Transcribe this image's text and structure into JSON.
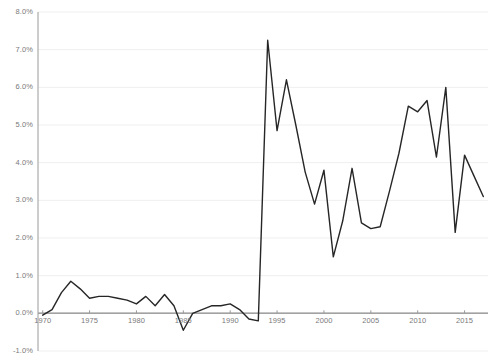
{
  "chart_data": {
    "type": "line",
    "title": "",
    "subtitle": "",
    "xlabel": "",
    "ylabel": "",
    "grid": true,
    "grid_axis": "y",
    "legend": false,
    "legend_position": "none",
    "xlim": [
      1969.5,
      2017.5
    ],
    "ylim": [
      -1.0,
      8.0
    ],
    "y_tick_labels": [
      "8.0%",
      "7.0%",
      "6.0%",
      "5.0%",
      "4.0%",
      "3.0%",
      "2.0%",
      "1.0%",
      "0.0%",
      "-1.0%"
    ],
    "y_tick_values": [
      8.0,
      7.0,
      6.0,
      5.0,
      4.0,
      3.0,
      2.0,
      1.0,
      0.0,
      -1.0
    ],
    "x_tick_labels": [
      "1970",
      "1975",
      "1980",
      "1985",
      "1990",
      "1995",
      "2000",
      "2005",
      "2010",
      "2015"
    ],
    "x_tick_values": [
      1970,
      1975,
      1980,
      1985,
      1990,
      1995,
      2000,
      2005,
      2010,
      2015
    ],
    "zero_line": 0.0,
    "series": [
      {
        "name": "series-1",
        "color": "#262626",
        "x": [
          1970,
          1971,
          1972,
          1973,
          1974,
          1975,
          1976,
          1977,
          1978,
          1979,
          1980,
          1981,
          1982,
          1983,
          1984,
          1985,
          1986,
          1987,
          1988,
          1989,
          1990,
          1991,
          1992,
          1993,
          1994,
          1995,
          1996,
          1997,
          1998,
          1999,
          2000,
          2001,
          2002,
          2003,
          2004,
          2005,
          2006,
          2007,
          2008,
          2009,
          2010,
          2011,
          2012,
          2013,
          2014,
          2015,
          2016,
          2017
        ],
        "values": [
          -0.05,
          0.1,
          0.55,
          0.85,
          0.65,
          0.4,
          0.45,
          0.45,
          0.4,
          0.35,
          0.25,
          0.45,
          0.2,
          0.5,
          0.2,
          -0.45,
          0.0,
          0.1,
          0.2,
          0.2,
          0.25,
          0.1,
          -0.15,
          -0.2,
          7.25,
          4.85,
          6.2,
          5.0,
          3.75,
          2.9,
          3.8,
          1.5,
          2.45,
          3.85,
          2.4,
          2.25,
          2.3,
          3.25,
          4.25,
          5.5,
          5.35,
          5.65,
          4.15,
          6.0,
          2.15,
          4.2,
          3.65,
          3.1
        ]
      }
    ]
  }
}
